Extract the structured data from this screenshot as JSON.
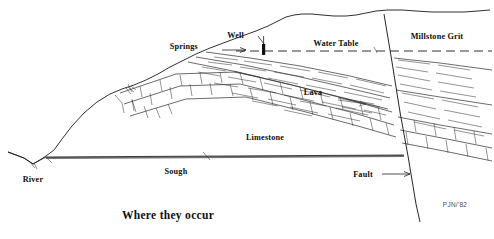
{
  "figure": {
    "title": "Where they occur",
    "signature": "PJN/'82",
    "type": "geological-cross-section",
    "background_color": "#ffffff",
    "ink_color": "#1a1a1a"
  },
  "labels": {
    "springs": "Springs",
    "well": "Well",
    "water_table": "Water Table",
    "millstone_grit": "Millstone Grit",
    "lava": "Lava",
    "limestone": "Limestone",
    "river": "River",
    "sough": "Sough",
    "fault": "Fault"
  },
  "annotations": [
    {
      "name": "springs",
      "text": "Springs",
      "x": 198,
      "y": 49,
      "leader": true,
      "leader_dir": "right"
    },
    {
      "name": "well",
      "text": "Well",
      "x": 244,
      "y": 39,
      "leader": true,
      "leader_dir": "down-right"
    },
    {
      "name": "water-table",
      "text": "Water Table",
      "x": 336,
      "y": 45,
      "leader": false
    },
    {
      "name": "millstone-grit",
      "text": "Millstone Grit",
      "x": 437,
      "y": 38,
      "leader": false
    },
    {
      "name": "lava",
      "text": "Lava",
      "x": 313,
      "y": 93,
      "leader": false
    },
    {
      "name": "limestone",
      "text": "Limestone",
      "x": 265,
      "y": 138,
      "leader": false
    },
    {
      "name": "river",
      "text": "River",
      "x": 33,
      "y": 182,
      "leader": false
    },
    {
      "name": "sough",
      "text": "Sough",
      "x": 176,
      "y": 172,
      "leader": true,
      "leader_dir": "up-right"
    },
    {
      "name": "fault",
      "text": "Fault",
      "x": 363,
      "y": 177,
      "leader": true,
      "leader_dir": "right"
    }
  ],
  "strata": [
    {
      "name": "millstone-grit",
      "label": "Millstone Grit",
      "pattern": "blank-upper"
    },
    {
      "name": "lava",
      "label": "Lava",
      "pattern": "horizontal-dash-hatch"
    },
    {
      "name": "limestone",
      "label": "Limestone",
      "pattern": "brick-blocks"
    }
  ],
  "features": [
    {
      "name": "water-table",
      "label": "Water Table",
      "style": "dashed-line"
    },
    {
      "name": "well",
      "label": "Well",
      "style": "solid-black-bar"
    },
    {
      "name": "springs",
      "label": "Springs",
      "style": "outcrop-point"
    },
    {
      "name": "sough",
      "label": "Sough",
      "style": "thick-horizontal-line"
    },
    {
      "name": "fault",
      "label": "Fault",
      "style": "steep-diagonal-line"
    },
    {
      "name": "river",
      "label": "River",
      "style": "valley-notch"
    }
  ]
}
